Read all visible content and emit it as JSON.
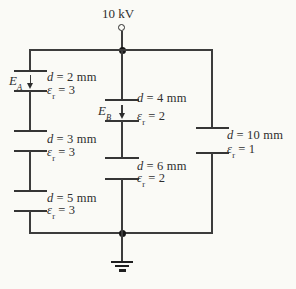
{
  "figure": {
    "type": "capacitor-network-circuit-diagram",
    "line_color": "#3c3c3c",
    "background": "#fafaf6"
  },
  "supply": {
    "voltage": "10 kV"
  },
  "fields": {
    "a": {
      "symbol": "E",
      "sub": "A",
      "direction": "down"
    },
    "b": {
      "symbol": "E",
      "sub": "B",
      "direction": "down"
    }
  },
  "capacitors": {
    "left": [
      {
        "d_symbol": "d",
        "d_value": "= 2 mm",
        "eps_symbol": "ε",
        "eps_sub": "r",
        "eps_value": "= 3"
      },
      {
        "d_symbol": "d",
        "d_value": "= 3 mm",
        "eps_symbol": "ε",
        "eps_sub": "r",
        "eps_value": "= 3"
      },
      {
        "d_symbol": "d",
        "d_value": "= 5 mm",
        "eps_symbol": "ε",
        "eps_sub": "r",
        "eps_value": "= 3"
      }
    ],
    "middle": [
      {
        "d_symbol": "d",
        "d_value": "= 4 mm",
        "eps_symbol": "ε",
        "eps_sub": "r",
        "eps_value": "= 2"
      },
      {
        "d_symbol": "d",
        "d_value": "= 6 mm",
        "eps_symbol": "ε",
        "eps_sub": "r",
        "eps_value": "= 2"
      }
    ],
    "right": [
      {
        "d_symbol": "d",
        "d_value": "= 10 mm",
        "eps_symbol": "ε",
        "eps_sub": "r",
        "eps_value": "= 1"
      }
    ]
  },
  "icons": {
    "ground": "earth-ground-icon",
    "terminal": "open-terminal-icon"
  }
}
